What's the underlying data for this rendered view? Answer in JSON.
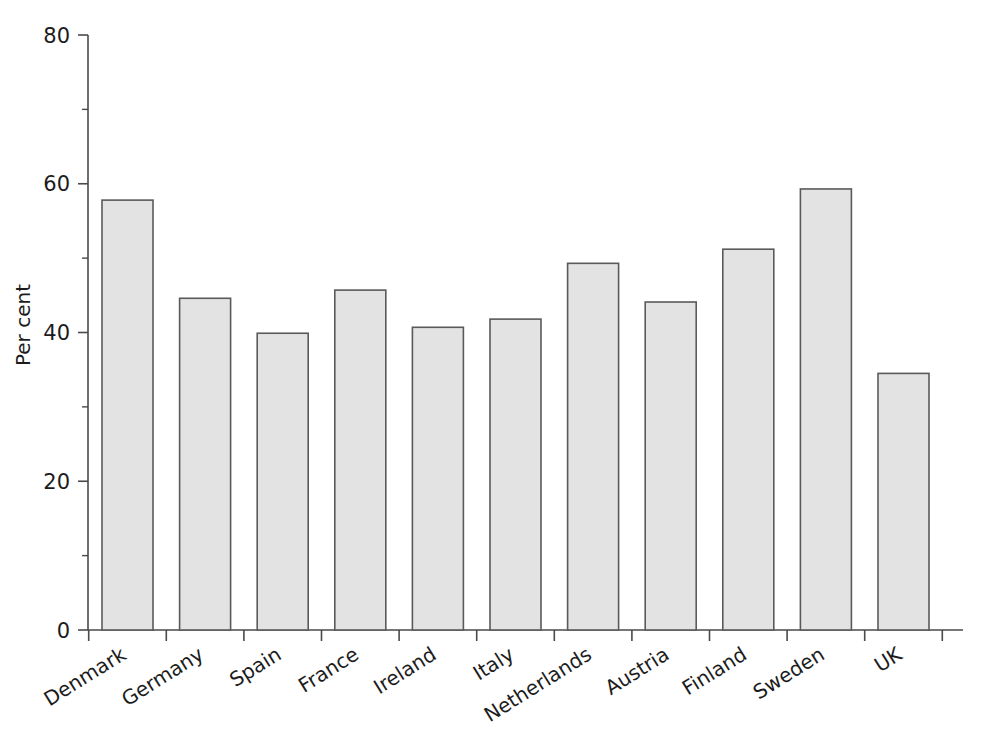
{
  "chart_data": {
    "type": "bar",
    "title": "",
    "subtitle": "",
    "xlabel": "",
    "ylabel": "Per cent",
    "categories": [
      "Denmark",
      "Germany",
      "Spain",
      "France",
      "Ireland",
      "Italy",
      "Netherlands",
      "Austria",
      "Finland",
      "Sweden",
      "UK"
    ],
    "values": [
      57.8,
      44.6,
      39.9,
      45.7,
      40.7,
      41.8,
      49.3,
      44.1,
      51.2,
      59.3,
      34.5
    ],
    "ylim": [
      0,
      80
    ],
    "y_major_ticks": [
      0,
      20,
      40,
      60,
      80
    ],
    "y_major_tick_labels": [
      "0",
      "20",
      "40",
      "60",
      "80"
    ],
    "y_minor_ticks": [
      10,
      30,
      50,
      70
    ],
    "grid": false,
    "legend": null,
    "legend_position": "none",
    "annotations": [],
    "bar_fill_color": "#e3e3e3",
    "bar_edge_color": "#5a5a5a",
    "axis_color": "#4a4a4a",
    "text_color": "#1c1c1c",
    "category_label_rotation_deg": -32
  }
}
